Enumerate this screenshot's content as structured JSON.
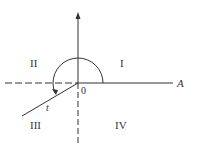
{
  "diagram": {
    "quadrants": {
      "q1": "I",
      "q2": "II",
      "q3": "III",
      "q4": "IV"
    },
    "origin_label": "0",
    "axis_label": "A",
    "ray_label": "t",
    "colors": {
      "stroke": "#333333",
      "background": "#ffffff"
    }
  }
}
